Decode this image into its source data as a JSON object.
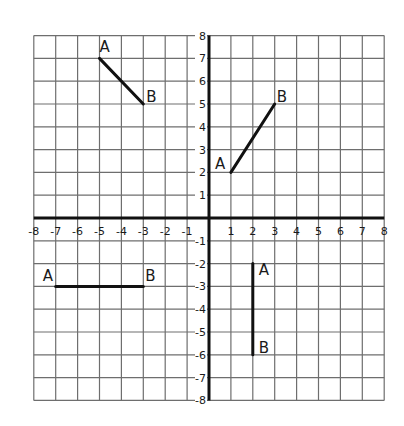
{
  "diagram": {
    "type": "coordinate-grid",
    "x_range": [
      -8,
      8
    ],
    "y_range": [
      -8,
      8
    ],
    "grid_step": 1,
    "x_tick_labels": [
      "-8",
      "-7",
      "-6",
      "-5",
      "-4",
      "-3",
      "-2",
      "-1",
      "1",
      "2",
      "3",
      "4",
      "5",
      "6",
      "7",
      "8"
    ],
    "y_tick_labels": [
      "8",
      "7",
      "6",
      "5",
      "4",
      "3",
      "2",
      "1",
      "-1",
      "-2",
      "-3",
      "-4",
      "-5",
      "-6",
      "-7",
      "-8"
    ],
    "colors": {
      "grid": "#6e6e6e",
      "axis": "#111111",
      "segment": "#111111",
      "background": "#ffffff"
    },
    "segments": [
      {
        "name": "segment-quadrant-2",
        "A": [
          -5,
          7
        ],
        "B": [
          -3,
          5
        ],
        "label_a": "A",
        "label_b": "B"
      },
      {
        "name": "segment-quadrant-1",
        "A": [
          1,
          2
        ],
        "B": [
          3,
          5
        ],
        "label_a": "A",
        "label_b": "B"
      },
      {
        "name": "segment-quadrant-3",
        "A": [
          -7,
          -3
        ],
        "B": [
          -3,
          -3
        ],
        "label_a": "A",
        "label_b": "B"
      },
      {
        "name": "segment-quadrant-4",
        "A": [
          2,
          -2
        ],
        "B": [
          2,
          -6
        ],
        "label_a": "A",
        "label_b": "B"
      }
    ]
  }
}
